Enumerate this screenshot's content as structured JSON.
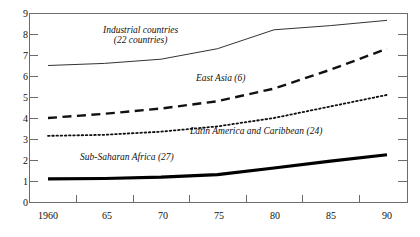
{
  "chart_data": {
    "type": "line",
    "title": "",
    "xlabel": "",
    "ylabel": "",
    "xlim": [
      1960,
      1990
    ],
    "ylim": [
      0,
      9
    ],
    "grid": false,
    "legend_position": "inline-annotations",
    "x": [
      1960,
      1965,
      1970,
      1975,
      1980,
      1985,
      1990
    ],
    "x_tick_labels": [
      "1960",
      "65",
      "70",
      "75",
      "80",
      "85",
      "90"
    ],
    "y_tick_labels": [
      "0",
      "1",
      "2",
      "3",
      "4",
      "5",
      "6",
      "7",
      "8",
      "9"
    ],
    "series": [
      {
        "name": "Industrial countries (22 countries)",
        "label_line1": "Industrial countries",
        "label_line2": "(22 countries)",
        "style": "solid",
        "width": 1,
        "color": "#333333",
        "values": [
          6.5,
          6.6,
          6.8,
          7.3,
          8.2,
          8.4,
          8.65
        ]
      },
      {
        "name": "East Asia (6)",
        "label_line1": "East Asia (6)",
        "label_line2": "",
        "style": "dashed",
        "width": 2.4,
        "color": "#111111",
        "values": [
          4.0,
          4.2,
          4.45,
          4.8,
          5.4,
          6.3,
          7.3
        ]
      },
      {
        "name": "Latin America and Caribbean (24)",
        "label_line1": "Latin America and Caribbean (24)",
        "label_line2": "",
        "style": "dotted",
        "width": 1.8,
        "color": "#111111",
        "values": [
          3.15,
          3.2,
          3.35,
          3.6,
          4.0,
          4.55,
          5.1
        ]
      },
      {
        "name": "Sub-Saharan Africa (27)",
        "label_line1": "Sub-Saharan Africa (27)",
        "label_line2": "",
        "style": "solid-thick",
        "width": 3.2,
        "color": "#000000",
        "values": [
          1.1,
          1.12,
          1.18,
          1.3,
          1.62,
          1.95,
          2.25
        ]
      }
    ]
  },
  "annotations": {
    "industrial_line1": "Industrial countries",
    "industrial_line2": "(22 countries)",
    "east_asia": "East Asia (6)",
    "latin_america": "Latin America and Caribbean (24)",
    "sub_saharan": "Sub-Saharan Africa (27)"
  },
  "axis": {
    "y_labels": [
      "9",
      "8",
      "7",
      "6",
      "5",
      "4",
      "3",
      "2",
      "1",
      "0"
    ],
    "x_labels": [
      "1960",
      "65",
      "70",
      "75",
      "80",
      "85",
      "90"
    ]
  }
}
